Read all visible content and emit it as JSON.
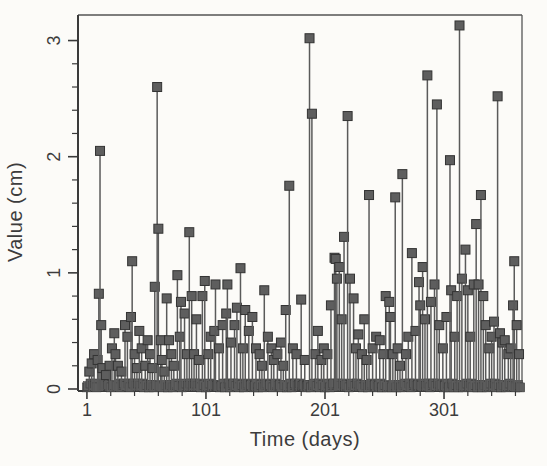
{
  "figure": {
    "xlabel": "Time (days)",
    "ylabel": "Value (cm)"
  },
  "chart_data": {
    "type": "stem",
    "title": "",
    "xlabel": "Time (days)",
    "ylabel": "Value (cm)",
    "xlim": [
      -6.5,
      366.5
    ],
    "ylim": [
      0,
      3.22
    ],
    "xticks": [
      1,
      101,
      201,
      301
    ],
    "xtick_labels": [
      "1",
      "101",
      "201",
      "301"
    ],
    "x_minor_step": 20,
    "x_minor_start": 21,
    "x_minor_end": 361,
    "yticks": [
      0,
      1,
      2,
      3
    ],
    "ytick_labels": [
      "0",
      "1",
      "2",
      "3"
    ],
    "y_minor_step": 0.2,
    "grid": false,
    "legend": null,
    "marker": "filled-square",
    "days_total": 365,
    "baseline_note": "Daily series over ~365 days; days not listed in points have values near 0 and their square markers overlap, forming the dark band along the x-axis.",
    "colors": {
      "background": "#fcfbf8",
      "axis": "#3a3a3a",
      "stem": "#5a5a5a",
      "marker_fill": "#5e5e5e",
      "marker_edge": "#333333",
      "text": "#3c3c3c"
    },
    "points": [
      [
        3,
        0.15
      ],
      [
        5,
        0.22
      ],
      [
        7,
        0.3
      ],
      [
        10,
        0.25
      ],
      [
        11,
        0.82
      ],
      [
        12,
        2.05
      ],
      [
        13,
        0.55
      ],
      [
        14,
        0.18
      ],
      [
        17,
        0.12
      ],
      [
        20,
        0.2
      ],
      [
        22,
        0.35
      ],
      [
        24,
        0.48
      ],
      [
        25,
        0.3
      ],
      [
        27,
        0.2
      ],
      [
        30,
        0.15
      ],
      [
        33,
        0.55
      ],
      [
        35,
        0.45
      ],
      [
        38,
        0.62
      ],
      [
        39,
        1.1
      ],
      [
        41,
        0.3
      ],
      [
        43,
        0.18
      ],
      [
        45,
        0.5
      ],
      [
        47,
        0.35
      ],
      [
        50,
        0.2
      ],
      [
        52,
        0.42
      ],
      [
        54,
        0.3
      ],
      [
        56,
        0.18
      ],
      [
        58,
        0.88
      ],
      [
        60,
        2.6
      ],
      [
        61,
        1.38
      ],
      [
        63,
        0.42
      ],
      [
        64,
        0.25
      ],
      [
        66,
        0.15
      ],
      [
        68,
        0.78
      ],
      [
        70,
        0.42
      ],
      [
        72,
        0.3
      ],
      [
        74,
        0.2
      ],
      [
        77,
        0.98
      ],
      [
        79,
        0.45
      ],
      [
        80,
        0.75
      ],
      [
        83,
        0.65
      ],
      [
        85,
        0.3
      ],
      [
        87,
        1.35
      ],
      [
        89,
        0.8
      ],
      [
        91,
        0.3
      ],
      [
        93,
        0.6
      ],
      [
        95,
        0.25
      ],
      [
        98,
        0.8
      ],
      [
        100,
        0.93
      ],
      [
        103,
        0.3
      ],
      [
        105,
        0.45
      ],
      [
        108,
        0.5
      ],
      [
        109,
        0.9
      ],
      [
        112,
        0.35
      ],
      [
        115,
        0.55
      ],
      [
        118,
        0.65
      ],
      [
        119,
        0.9
      ],
      [
        122,
        0.4
      ],
      [
        125,
        0.55
      ],
      [
        127,
        0.7
      ],
      [
        130,
        1.04
      ],
      [
        132,
        0.35
      ],
      [
        134,
        0.68
      ],
      [
        137,
        0.5
      ],
      [
        140,
        0.62
      ],
      [
        143,
        0.35
      ],
      [
        146,
        0.3
      ],
      [
        148,
        0.2
      ],
      [
        150,
        0.85
      ],
      [
        153,
        0.45
      ],
      [
        156,
        0.35
      ],
      [
        158,
        0.25
      ],
      [
        161,
        0.3
      ],
      [
        164,
        0.4
      ],
      [
        166,
        0.2
      ],
      [
        168,
        0.68
      ],
      [
        171,
        1.75
      ],
      [
        174,
        0.35
      ],
      [
        177,
        0.3
      ],
      [
        181,
        0.77
      ],
      [
        184,
        0.25
      ],
      [
        188,
        3.02
      ],
      [
        190,
        2.37
      ],
      [
        193,
        0.3
      ],
      [
        195,
        0.5
      ],
      [
        198,
        0.25
      ],
      [
        200,
        0.35
      ],
      [
        203,
        0.3
      ],
      [
        206,
        0.72
      ],
      [
        209,
        1.13
      ],
      [
        210,
        1.12
      ],
      [
        211,
        0.95
      ],
      [
        213,
        1.05
      ],
      [
        215,
        0.6
      ],
      [
        217,
        1.31
      ],
      [
        220,
        2.35
      ],
      [
        222,
        0.95
      ],
      [
        225,
        0.78
      ],
      [
        227,
        0.35
      ],
      [
        229,
        0.47
      ],
      [
        232,
        0.3
      ],
      [
        234,
        0.6
      ],
      [
        236,
        0.25
      ],
      [
        238,
        1.67
      ],
      [
        241,
        0.35
      ],
      [
        244,
        0.45
      ],
      [
        247,
        0.42
      ],
      [
        250,
        0.3
      ],
      [
        252,
        0.8
      ],
      [
        255,
        0.75
      ],
      [
        256,
        0.62
      ],
      [
        258,
        0.3
      ],
      [
        260,
        1.65
      ],
      [
        262,
        0.35
      ],
      [
        264,
        0.2
      ],
      [
        266,
        1.85
      ],
      [
        269,
        0.3
      ],
      [
        271,
        0.45
      ],
      [
        274,
        1.17
      ],
      [
        277,
        0.5
      ],
      [
        280,
        0.92
      ],
      [
        281,
        0.72
      ],
      [
        283,
        1.05
      ],
      [
        285,
        0.6
      ],
      [
        287,
        2.7
      ],
      [
        290,
        0.75
      ],
      [
        293,
        0.9
      ],
      [
        295,
        2.45
      ],
      [
        297,
        0.55
      ],
      [
        300,
        0.35
      ],
      [
        303,
        0.62
      ],
      [
        306,
        1.97
      ],
      [
        307,
        0.85
      ],
      [
        310,
        0.45
      ],
      [
        312,
        0.8
      ],
      [
        314,
        3.13
      ],
      [
        316,
        0.95
      ],
      [
        319,
        1.2
      ],
      [
        321,
        0.85
      ],
      [
        323,
        0.45
      ],
      [
        326,
        0.9
      ],
      [
        328,
        1.42
      ],
      [
        330,
        0.9
      ],
      [
        332,
        1.67
      ],
      [
        334,
        0.8
      ],
      [
        336,
        0.55
      ],
      [
        339,
        0.35
      ],
      [
        341,
        0.45
      ],
      [
        343,
        0.58
      ],
      [
        346,
        2.52
      ],
      [
        348,
        0.48
      ],
      [
        350,
        0.4
      ],
      [
        352,
        0.42
      ],
      [
        355,
        0.3
      ],
      [
        357,
        0.35
      ],
      [
        359,
        0.72
      ],
      [
        360,
        1.1
      ],
      [
        362,
        0.55
      ],
      [
        364,
        0.3
      ]
    ]
  }
}
